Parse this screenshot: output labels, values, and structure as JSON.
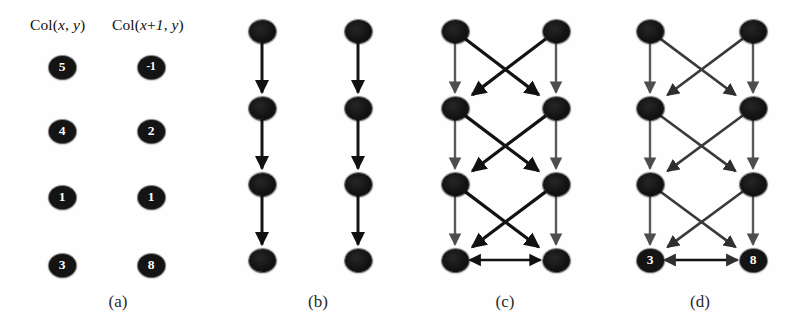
{
  "figure": {
    "width": 804,
    "height": 317,
    "background": "#fefefe",
    "node_color": "#141414",
    "node_label_color": "#ffffff",
    "vertical_edge_color": "#5a5a5a",
    "diagonal_edge_color": "#121212"
  },
  "panels": [
    {
      "id": "a",
      "label": "(a)",
      "label_x": 118,
      "label_y": 292,
      "headers": [
        {
          "text": "Col(x, y)",
          "x": 30,
          "y": 16
        },
        {
          "text": "Col(x+1, y)",
          "x": 112,
          "y": 16
        }
      ],
      "columns": [
        {
          "name": "col-x",
          "x": 62,
          "values": [
            "5",
            "4",
            "1",
            "3"
          ]
        },
        {
          "name": "col-x-plus-1",
          "x": 151,
          "values": [
            "-1",
            "2",
            "1",
            "8"
          ]
        }
      ],
      "row_y": [
        67,
        131,
        197,
        265
      ],
      "edges": []
    },
    {
      "id": "b",
      "label": "(b)",
      "label_x": 318,
      "label_y": 292,
      "headers": [],
      "columns": [
        {
          "name": "col-x",
          "x": 262,
          "values": [
            "",
            "",
            "",
            ""
          ]
        },
        {
          "name": "col-x-plus-1",
          "x": 358,
          "values": [
            "",
            "",
            "",
            ""
          ]
        }
      ],
      "row_y": [
        31,
        108,
        184,
        260
      ],
      "edge_style": "vertical-only",
      "edges": [
        {
          "type": "vertical",
          "col": 0,
          "from_row": 0,
          "to_row": 1
        },
        {
          "type": "vertical",
          "col": 0,
          "from_row": 1,
          "to_row": 2
        },
        {
          "type": "vertical",
          "col": 0,
          "from_row": 2,
          "to_row": 3
        },
        {
          "type": "vertical",
          "col": 1,
          "from_row": 0,
          "to_row": 1
        },
        {
          "type": "vertical",
          "col": 1,
          "from_row": 1,
          "to_row": 2
        },
        {
          "type": "vertical",
          "col": 1,
          "from_row": 2,
          "to_row": 3
        }
      ]
    },
    {
      "id": "c",
      "label": "(c)",
      "label_x": 505,
      "label_y": 292,
      "headers": [],
      "columns": [
        {
          "name": "col-x",
          "x": 455,
          "values": [
            "",
            "",
            "",
            ""
          ]
        },
        {
          "name": "col-x-plus-1",
          "x": 556,
          "values": [
            "",
            "",
            "",
            ""
          ]
        }
      ],
      "row_y": [
        31,
        108,
        184,
        260
      ],
      "edge_style": "vertical-and-cross",
      "edges": [
        {
          "type": "vertical",
          "col": 0,
          "from_row": 0,
          "to_row": 1
        },
        {
          "type": "vertical",
          "col": 0,
          "from_row": 1,
          "to_row": 2
        },
        {
          "type": "vertical",
          "col": 0,
          "from_row": 2,
          "to_row": 3
        },
        {
          "type": "vertical",
          "col": 1,
          "from_row": 0,
          "to_row": 1
        },
        {
          "type": "vertical",
          "col": 1,
          "from_row": 1,
          "to_row": 2
        },
        {
          "type": "vertical",
          "col": 1,
          "from_row": 2,
          "to_row": 3
        },
        {
          "type": "diagonal",
          "from_col": 0,
          "from_row": 0,
          "to_col": 1,
          "to_row": 1
        },
        {
          "type": "diagonal",
          "from_col": 1,
          "from_row": 0,
          "to_col": 0,
          "to_row": 1
        },
        {
          "type": "diagonal",
          "from_col": 0,
          "from_row": 1,
          "to_col": 1,
          "to_row": 2
        },
        {
          "type": "diagonal",
          "from_col": 1,
          "from_row": 1,
          "to_col": 0,
          "to_row": 2
        },
        {
          "type": "diagonal",
          "from_col": 0,
          "from_row": 2,
          "to_col": 1,
          "to_row": 3
        },
        {
          "type": "diagonal",
          "from_col": 1,
          "from_row": 2,
          "to_col": 0,
          "to_row": 3
        },
        {
          "type": "bidirectional",
          "row": 3,
          "from_col": 0,
          "to_col": 1
        }
      ]
    },
    {
      "id": "d",
      "label": "(d)",
      "label_x": 700,
      "label_y": 292,
      "headers": [],
      "columns": [
        {
          "name": "col-x",
          "x": 650,
          "values": [
            "",
            "",
            "",
            "3"
          ]
        },
        {
          "name": "col-x-plus-1",
          "x": 753,
          "values": [
            "",
            "",
            "",
            "8"
          ]
        }
      ],
      "row_y": [
        31,
        108,
        184,
        260
      ],
      "edge_style": "vertical-and-cross",
      "edges": [
        {
          "type": "vertical",
          "col": 0,
          "from_row": 0,
          "to_row": 1
        },
        {
          "type": "vertical",
          "col": 0,
          "from_row": 1,
          "to_row": 2
        },
        {
          "type": "vertical",
          "col": 0,
          "from_row": 2,
          "to_row": 3
        },
        {
          "type": "vertical",
          "col": 1,
          "from_row": 0,
          "to_row": 1
        },
        {
          "type": "vertical",
          "col": 1,
          "from_row": 1,
          "to_row": 2
        },
        {
          "type": "vertical",
          "col": 1,
          "from_row": 2,
          "to_row": 3
        },
        {
          "type": "diagonal",
          "from_col": 0,
          "from_row": 0,
          "to_col": 1,
          "to_row": 1
        },
        {
          "type": "diagonal",
          "from_col": 1,
          "from_row": 0,
          "to_col": 0,
          "to_row": 1
        },
        {
          "type": "diagonal",
          "from_col": 0,
          "from_row": 1,
          "to_col": 1,
          "to_row": 2
        },
        {
          "type": "diagonal",
          "from_col": 1,
          "from_row": 1,
          "to_col": 0,
          "to_row": 2
        },
        {
          "type": "diagonal",
          "from_col": 0,
          "from_row": 2,
          "to_col": 1,
          "to_row": 3
        },
        {
          "type": "diagonal",
          "from_col": 1,
          "from_row": 2,
          "to_col": 0,
          "to_row": 3
        },
        {
          "type": "bidirectional",
          "row": 3,
          "from_col": 0,
          "to_col": 1
        }
      ]
    }
  ]
}
